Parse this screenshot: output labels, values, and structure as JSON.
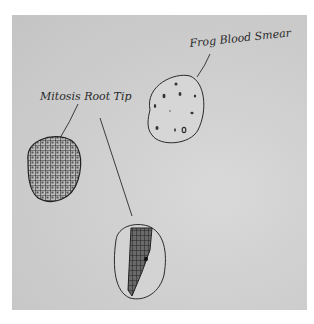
{
  "diagram": {
    "type": "hand-drawn sketch",
    "background_color": "#cfcfcf",
    "ink_color": "#2a2a2a",
    "labels": [
      {
        "id": "frog-blood-smear",
        "text": "Frog Blood Smear"
      },
      {
        "id": "mitosis-root-tip",
        "text": "Mitosis Root Tip"
      }
    ],
    "specimens": [
      {
        "id": "frog-blood-smear-circle",
        "description": "oval with scattered dark cell nuclei"
      },
      {
        "id": "mitosis-cells-circle",
        "description": "oval densely filled with grid of cells"
      },
      {
        "id": "root-tip-circle",
        "description": "oval containing tapered root tip with dark cells"
      }
    ]
  }
}
